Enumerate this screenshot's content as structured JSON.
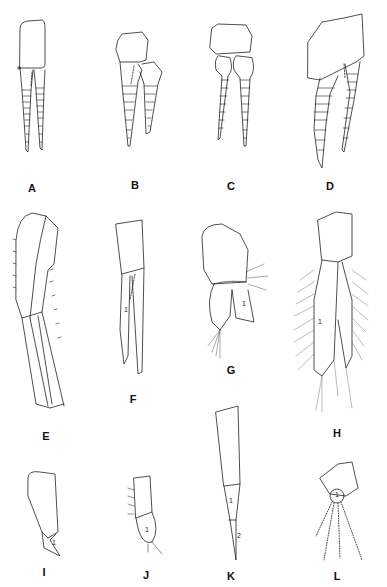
{
  "figure": {
    "panels": [
      {
        "id": "A",
        "label": "A",
        "x": 32,
        "y": 182
      },
      {
        "id": "B",
        "label": "B",
        "x": 135,
        "y": 179
      },
      {
        "id": "C",
        "label": "C",
        "x": 231,
        "y": 180
      },
      {
        "id": "D",
        "label": "D",
        "x": 330,
        "y": 180
      },
      {
        "id": "E",
        "label": "E",
        "x": 46,
        "y": 430
      },
      {
        "id": "F",
        "label": "F",
        "x": 133,
        "y": 393
      },
      {
        "id": "G",
        "label": "G",
        "x": 231,
        "y": 364
      },
      {
        "id": "H",
        "label": "H",
        "x": 337,
        "y": 427
      },
      {
        "id": "I",
        "label": "I",
        "x": 44,
        "y": 566
      },
      {
        "id": "J",
        "label": "J",
        "x": 146,
        "y": 569
      },
      {
        "id": "K",
        "label": "K",
        "x": 231,
        "y": 570
      },
      {
        "id": "L",
        "label": "L",
        "x": 337,
        "y": 570
      }
    ],
    "segment_labels": [
      {
        "panel": "F",
        "text": "1",
        "x": 124,
        "y": 306
      },
      {
        "panel": "G",
        "text": "1",
        "x": 242,
        "y": 300
      },
      {
        "panel": "H",
        "text": "1",
        "x": 318,
        "y": 318
      },
      {
        "panel": "I",
        "text": "1",
        "x": 52,
        "y": 539
      },
      {
        "panel": "J",
        "text": "1",
        "x": 145,
        "y": 526
      },
      {
        "panel": "K",
        "text": "1",
        "x": 229,
        "y": 497
      },
      {
        "panel": "K",
        "text": "2",
        "x": 237,
        "y": 532
      },
      {
        "panel": "L",
        "text": "1",
        "x": 337,
        "y": 493
      }
    ]
  }
}
